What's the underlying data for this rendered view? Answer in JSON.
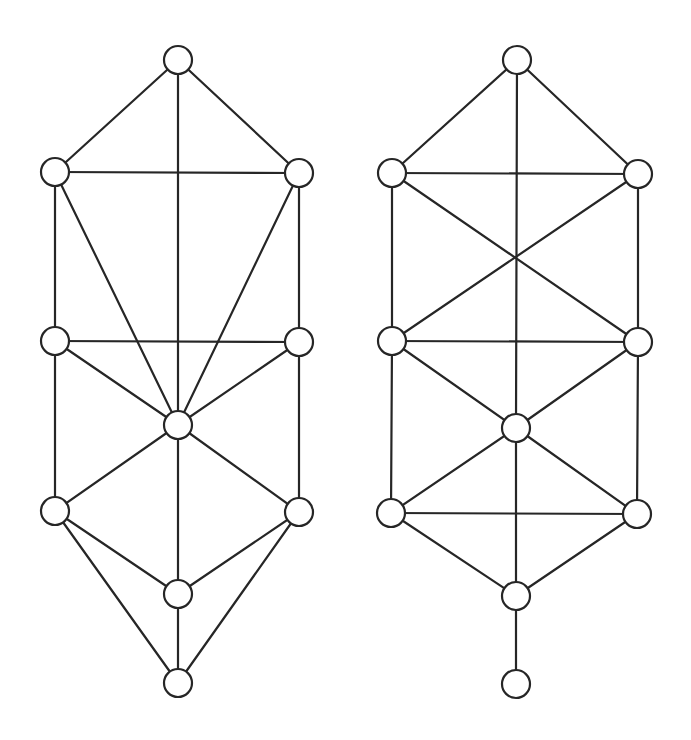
{
  "figure": {
    "style": {
      "background": "#ffffff",
      "stroke_color": "#262626",
      "node_fill": "#ffffff",
      "node_radius": 14
    },
    "graphs": [
      {
        "name": "left-graph",
        "nodes": [
          {
            "id": "top",
            "x": 178,
            "y": 60
          },
          {
            "id": "upper-left",
            "x": 55,
            "y": 172
          },
          {
            "id": "upper-right",
            "x": 299,
            "y": 173
          },
          {
            "id": "middle-left",
            "x": 55,
            "y": 341
          },
          {
            "id": "middle-right",
            "x": 299,
            "y": 342
          },
          {
            "id": "center",
            "x": 178,
            "y": 425
          },
          {
            "id": "lower-left",
            "x": 55,
            "y": 511
          },
          {
            "id": "lower-right",
            "x": 299,
            "y": 512
          },
          {
            "id": "bottom-inner",
            "x": 178,
            "y": 594
          },
          {
            "id": "bottom",
            "x": 178,
            "y": 683
          }
        ],
        "edges": [
          [
            "top",
            "upper-left"
          ],
          [
            "top",
            "upper-right"
          ],
          [
            "top",
            "center"
          ],
          [
            "upper-left",
            "upper-right"
          ],
          [
            "upper-left",
            "middle-left"
          ],
          [
            "upper-left",
            "center"
          ],
          [
            "upper-right",
            "middle-right"
          ],
          [
            "upper-right",
            "center"
          ],
          [
            "middle-left",
            "middle-right"
          ],
          [
            "middle-left",
            "center"
          ],
          [
            "middle-left",
            "lower-left"
          ],
          [
            "middle-right",
            "center"
          ],
          [
            "middle-right",
            "lower-right"
          ],
          [
            "center",
            "lower-left"
          ],
          [
            "center",
            "lower-right"
          ],
          [
            "center",
            "bottom-inner"
          ],
          [
            "lower-left",
            "bottom-inner"
          ],
          [
            "lower-left",
            "bottom"
          ],
          [
            "lower-right",
            "bottom-inner"
          ],
          [
            "lower-right",
            "bottom"
          ],
          [
            "bottom-inner",
            "bottom"
          ]
        ]
      },
      {
        "name": "right-graph",
        "nodes": [
          {
            "id": "top",
            "x": 517,
            "y": 60
          },
          {
            "id": "upper-left",
            "x": 392,
            "y": 173
          },
          {
            "id": "upper-right",
            "x": 638,
            "y": 174
          },
          {
            "id": "middle-left",
            "x": 392,
            "y": 341
          },
          {
            "id": "middle-right",
            "x": 638,
            "y": 342
          },
          {
            "id": "center",
            "x": 516,
            "y": 428
          },
          {
            "id": "lower-left",
            "x": 391,
            "y": 513
          },
          {
            "id": "lower-right",
            "x": 637,
            "y": 514
          },
          {
            "id": "bottom-inner",
            "x": 516,
            "y": 596
          },
          {
            "id": "bottom",
            "x": 516,
            "y": 684
          }
        ],
        "edges": [
          [
            "top",
            "upper-left"
          ],
          [
            "top",
            "upper-right"
          ],
          [
            "top",
            "center"
          ],
          [
            "upper-left",
            "upper-right"
          ],
          [
            "upper-left",
            "middle-left"
          ],
          [
            "upper-left",
            "middle-right"
          ],
          [
            "upper-right",
            "middle-right"
          ],
          [
            "upper-right",
            "middle-left"
          ],
          [
            "middle-left",
            "middle-right"
          ],
          [
            "middle-left",
            "center"
          ],
          [
            "middle-left",
            "lower-left"
          ],
          [
            "middle-right",
            "center"
          ],
          [
            "middle-right",
            "lower-right"
          ],
          [
            "center",
            "lower-left"
          ],
          [
            "center",
            "lower-right"
          ],
          [
            "center",
            "bottom-inner"
          ],
          [
            "lower-left",
            "lower-right"
          ],
          [
            "lower-left",
            "bottom-inner"
          ],
          [
            "lower-right",
            "bottom-inner"
          ],
          [
            "bottom-inner",
            "bottom"
          ]
        ]
      }
    ]
  }
}
